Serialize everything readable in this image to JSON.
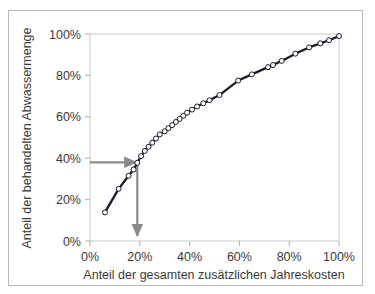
{
  "figure": {
    "border_color": "#b9b9b9",
    "background": "#ffffff"
  },
  "chart_data": {
    "type": "line",
    "title": "",
    "xlabel": "Anteil der gesamten zusätzlichen Jahreskosten",
    "ylabel": "Anteil der behandelten Abwassermenge",
    "xlim": [
      0,
      100
    ],
    "ylim": [
      0,
      100
    ],
    "xticks": [
      0,
      20,
      40,
      60,
      80,
      100
    ],
    "xtick_labels": [
      "0%",
      "20%",
      "40%",
      "60%",
      "80%",
      "100%"
    ],
    "yticks": [
      0,
      20,
      40,
      60,
      80,
      100
    ],
    "ytick_labels": [
      "0%",
      "20%",
      "40%",
      "60%",
      "80%",
      "100%"
    ],
    "grid": false,
    "legend": "none",
    "line_color": "#1a1a2e",
    "marker": "circle-open",
    "marker_fill": "#ffffff",
    "marker_edge": "#1a1a2e",
    "x": [
      6.0,
      11.5,
      15.5,
      17.5,
      19.0,
      20.5,
      22.0,
      23.5,
      25.0,
      26.5,
      28.0,
      30.0,
      31.5,
      33.0,
      34.5,
      36.0,
      37.5,
      39.0,
      41.0,
      43.0,
      45.5,
      48.0,
      52.0,
      59.5,
      65.0,
      71.5,
      73.5,
      77.0,
      82.5,
      88.0,
      92.5,
      96.0,
      100.0
    ],
    "y": [
      13.8,
      25.2,
      31.5,
      34.5,
      37.8,
      41.0,
      43.5,
      45.5,
      47.5,
      49.5,
      51.5,
      53.0,
      54.5,
      56.0,
      57.5,
      59.0,
      60.5,
      62.0,
      63.5,
      65.0,
      66.5,
      68.0,
      70.5,
      77.5,
      80.5,
      84.0,
      85.0,
      87.0,
      90.5,
      93.5,
      95.5,
      97.0,
      99.0
    ],
    "annotations": [
      {
        "name": "horizontal-guide-arrow",
        "type": "arrow",
        "from": [
          0,
          38
        ],
        "to": [
          19,
          38
        ],
        "color": "#808080",
        "label": "40%"
      },
      {
        "name": "vertical-guide-arrow",
        "type": "arrow",
        "from": [
          19,
          38
        ],
        "to": [
          19,
          0
        ],
        "color": "#808080",
        "label": "20%"
      }
    ]
  }
}
